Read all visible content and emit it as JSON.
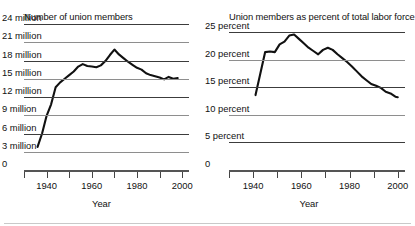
{
  "figure": {
    "panels": [
      {
        "id": "union-members-count",
        "title": "Number of union members",
        "xlabel": "Year",
        "ylabels": [
          "24 million",
          "21 million",
          "18 million",
          "15 million",
          "12 million",
          "9 million",
          "6 million",
          "3 million",
          "0"
        ],
        "xticklabels": [
          "1940",
          "1960",
          "1980",
          "2000"
        ]
      },
      {
        "id": "union-members-percent",
        "title": "Union members as percent of total labor force",
        "xlabel": "Year",
        "ylabels": [
          "25 percent",
          "20 percent",
          "15 percent",
          "10 percent",
          "5 percent",
          "0"
        ],
        "xticklabels": [
          "1940",
          "1960",
          "1980",
          "2000"
        ]
      }
    ]
  },
  "chart_data": [
    {
      "type": "line",
      "title": "Number of union members",
      "xlabel": "Year",
      "ylabel": "",
      "xlim": [
        1930,
        2003
      ],
      "ylim": [
        0,
        24
      ],
      "yticks": [
        24,
        21,
        18,
        15,
        12,
        9,
        6,
        3,
        0
      ],
      "ytick_labels": [
        "24 million",
        "21 million",
        "18 million",
        "15 million",
        "12 million",
        "9 million",
        "6 million",
        "3 million",
        "0"
      ],
      "xticks": [
        1940,
        1960,
        1980,
        2000
      ],
      "xminorticks": [
        1930,
        1950,
        1970,
        1990
      ],
      "grid": "horizontal",
      "legend": "none",
      "units": "millions of members",
      "series": [
        {
          "name": "Union members",
          "x": [
            1936,
            1938,
            1940,
            1942,
            1944,
            1946,
            1948,
            1950,
            1952,
            1954,
            1956,
            1958,
            1960,
            1962,
            1964,
            1966,
            1968,
            1970,
            1972,
            1974,
            1976,
            1978,
            1980,
            1982,
            1984,
            1986,
            1988,
            1990,
            1992,
            1994,
            1996,
            1998
          ],
          "values": [
            3.8,
            6.0,
            8.9,
            10.8,
            13.6,
            14.4,
            15.0,
            15.6,
            16.2,
            17.0,
            17.4,
            17.1,
            17.0,
            16.9,
            17.2,
            17.9,
            18.9,
            19.8,
            19.0,
            18.4,
            17.8,
            17.3,
            16.8,
            16.5,
            15.9,
            15.6,
            15.4,
            15.2,
            14.9,
            15.3,
            15.0,
            15.1
          ]
        }
      ]
    },
    {
      "type": "line",
      "title": "Union members as percent of total labor force",
      "xlabel": "Year",
      "ylabel": "",
      "xlim": [
        1930,
        2003
      ],
      "ylim": [
        0,
        26.5
      ],
      "yticks": [
        25,
        20,
        15,
        10,
        5,
        0
      ],
      "ytick_labels": [
        "25 percent",
        "20 percent",
        "15 percent",
        "10 percent",
        "5 percent",
        "0"
      ],
      "xticks": [
        1940,
        1960,
        1980,
        2000
      ],
      "xminorticks": [
        1930,
        1950,
        1970,
        1990
      ],
      "grid": "horizontal",
      "legend": "none",
      "units": "percent of total labor force",
      "series": [
        {
          "name": "Union members as percent of labor force",
          "x": [
            1941,
            1943,
            1945,
            1947,
            1949,
            1951,
            1953,
            1955,
            1957,
            1959,
            1961,
            1963,
            1965,
            1967,
            1969,
            1971,
            1973,
            1975,
            1977,
            1979,
            1981,
            1983,
            1985,
            1987,
            1989,
            1991,
            1993,
            1995,
            1997,
            1999,
            2000
          ],
          "values": [
            13.6,
            17.5,
            21.4,
            21.5,
            21.4,
            22.8,
            23.3,
            24.4,
            24.6,
            23.8,
            23.0,
            22.2,
            21.6,
            21.0,
            21.8,
            22.2,
            21.8,
            21.0,
            20.3,
            19.6,
            18.8,
            17.9,
            17.0,
            16.3,
            15.6,
            15.3,
            14.9,
            14.2,
            13.9,
            13.3,
            13.2
          ]
        }
      ]
    }
  ]
}
